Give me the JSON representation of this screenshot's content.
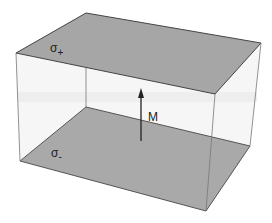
{
  "diagram": {
    "labels": {
      "top_surface": "σ",
      "top_surface_sub": "+",
      "bottom_surface": "σ",
      "bottom_surface_sub": "-",
      "arrow": "M"
    },
    "colors": {
      "surface_fill": "#a8a8a8",
      "side_fill": "#f4f4f4",
      "edge": "#444444",
      "arrow": "#222222"
    }
  }
}
